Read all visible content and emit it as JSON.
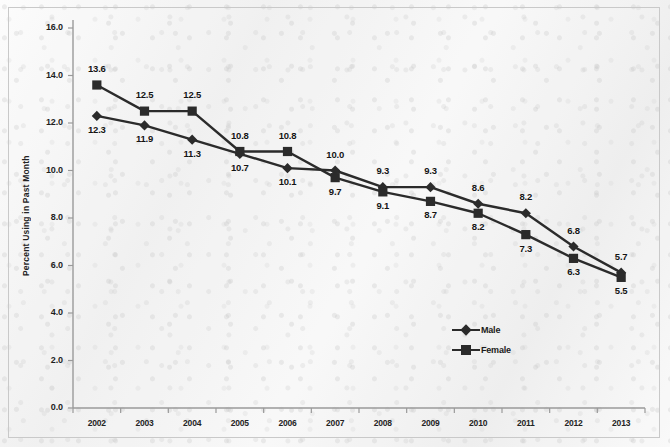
{
  "chart_data": {
    "type": "line",
    "title": "",
    "subtitle": "",
    "xlabel": "",
    "ylabel": "Percent Using in Past Month",
    "categories": [
      "2002",
      "2003",
      "2004",
      "2005",
      "2006",
      "2007",
      "2008",
      "2009",
      "2010",
      "2011",
      "2012",
      "2013"
    ],
    "x": [
      2002,
      2003,
      2004,
      2005,
      2006,
      2007,
      2008,
      2009,
      2010,
      2011,
      2012,
      2013
    ],
    "series": [
      {
        "name": "Male",
        "marker": "diamond",
        "color": "#2b2b2b",
        "values": [
          12.3,
          11.9,
          11.3,
          10.7,
          10.1,
          10.0,
          9.3,
          9.3,
          8.6,
          8.2,
          6.8,
          5.7
        ],
        "label_positions": [
          "below",
          "below",
          "below",
          "below",
          "below",
          "above",
          "above",
          "above",
          "above",
          "above",
          "above",
          "above"
        ]
      },
      {
        "name": "Female",
        "marker": "square",
        "color": "#2b2b2b",
        "values": [
          13.6,
          12.5,
          12.5,
          10.8,
          10.8,
          9.7,
          9.1,
          8.7,
          8.2,
          7.3,
          6.3,
          5.5
        ],
        "label_positions": [
          "above",
          "above",
          "above",
          "above",
          "above",
          "below",
          "below",
          "below",
          "below",
          "below",
          "below",
          "below"
        ]
      }
    ],
    "ylim": [
      0.0,
      16.0
    ],
    "yticks": [
      "0.0",
      "2.0",
      "4.0",
      "6.0",
      "8.0",
      "10.0",
      "12.0",
      "14.0",
      "16.0"
    ],
    "ytick_values": [
      0.0,
      2.0,
      4.0,
      6.0,
      8.0,
      10.0,
      12.0,
      14.0,
      16.0
    ],
    "grid": false,
    "legend_position": "inside-bottom-right",
    "legend": [
      "Male",
      "Female"
    ],
    "background_color": "#f3f3f3",
    "line_color": "#2b2b2b",
    "axis_color": "#9a9a9a"
  }
}
